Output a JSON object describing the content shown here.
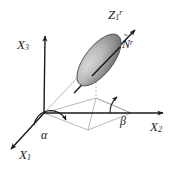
{
  "figure": {
    "type": "3d-coordinate-diagram",
    "background_color": "#ffffff",
    "line_color": "#1a1a1a",
    "faint_line_color": "#9a9a9a",
    "disk_fill_light": "#cfcfcf",
    "disk_fill_dark": "#6e6e6e",
    "disk_edge_color": "#555555"
  },
  "labels": {
    "axis_x1": {
      "base": "X",
      "sub": "1",
      "sup": ""
    },
    "axis_x2": {
      "base": "X",
      "sub": "2",
      "sup": ""
    },
    "axis_x3": {
      "base": "X",
      "sub": "3",
      "sup": ""
    },
    "axis_z1r": {
      "base": "Z",
      "sub": "1",
      "sup": "r"
    },
    "normal_vector": {
      "base": "N",
      "sub": "",
      "sup": "r",
      "accent": "˜"
    },
    "angle_alpha": {
      "text": "α"
    },
    "angle_beta": {
      "text": "β"
    }
  },
  "geometry": {
    "origin": {
      "x": 44,
      "y": 113
    },
    "axis_x3_tip": {
      "x": 45,
      "y": 33
    },
    "axis_x2_tip": {
      "x": 166,
      "y": 113
    },
    "axis_x1_tip": {
      "x": 8,
      "y": 152
    },
    "axis_z1r_tip": {
      "x": 138,
      "y": 27
    },
    "disk_center": {
      "x": 99,
      "y": 60
    },
    "disk_rx": 31,
    "disk_ry": 14,
    "disk_rotation_deg": -52,
    "angle_alpha_deg": 38,
    "angle_beta_deg": 112
  }
}
